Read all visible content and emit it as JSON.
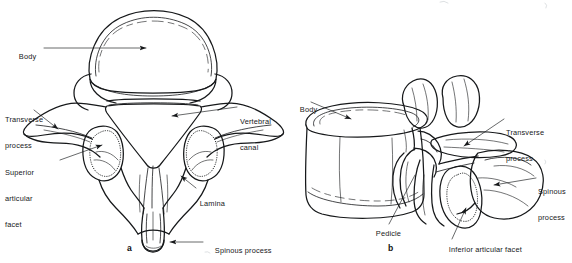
{
  "figure": {
    "background_color": "#ffffff",
    "ink_color": "#16181a",
    "panels": [
      {
        "id": "a",
        "letter": "a",
        "view": "superior view of lumbar vertebra",
        "labels": [
          {
            "key": "body",
            "text": "Body",
            "lines": [
              "Body"
            ]
          },
          {
            "key": "transverse",
            "text": "Transverse process",
            "lines": [
              "Transverse",
              "process"
            ]
          },
          {
            "key": "superior_facet",
            "text": "Superior articular facet",
            "lines": [
              "Superior",
              "articular",
              "facet"
            ]
          },
          {
            "key": "vertebral_canal",
            "text": "Vertebral canal",
            "lines": [
              "Vertebral",
              "canal"
            ]
          },
          {
            "key": "lamina",
            "text": "Lamina",
            "lines": [
              "Lamina"
            ]
          },
          {
            "key": "spinous",
            "text": "Spinous process",
            "lines": [
              "Spinous process"
            ]
          }
        ]
      },
      {
        "id": "b",
        "letter": "b",
        "view": "oblique lateral view of lumbar vertebra",
        "labels": [
          {
            "key": "body",
            "text": "Body",
            "lines": [
              "Body"
            ]
          },
          {
            "key": "transverse",
            "text": "Transverse process",
            "lines": [
              "Transverse",
              "process"
            ]
          },
          {
            "key": "spinous",
            "text": "Spinous process",
            "lines": [
              "Spinous",
              "process"
            ]
          },
          {
            "key": "pedicle",
            "text": "Pedicle",
            "lines": [
              "Pedicle"
            ]
          },
          {
            "key": "inferior_facet",
            "text": "Inferior articular facet",
            "lines": [
              "Inferior articular facet"
            ]
          }
        ]
      }
    ]
  },
  "labels_flat": {
    "a_body": "Body",
    "a_transverse_1": "Transverse",
    "a_transverse_2": "process",
    "a_superior_1": "Superior",
    "a_superior_2": "articular",
    "a_superior_3": "facet",
    "a_canal_1": "Vertebral",
    "a_canal_2": "canal",
    "a_lamina": "Lamina",
    "a_spinous": "Spinous process",
    "a_letter": "a",
    "b_body": "Body",
    "b_transverse_1": "Transverse",
    "b_transverse_2": "process",
    "b_spinous_1": "Spinous",
    "b_spinous_2": "process",
    "b_pedicle": "Pedicle",
    "b_inferior": "Inferior articular facet",
    "b_letter": "b"
  }
}
